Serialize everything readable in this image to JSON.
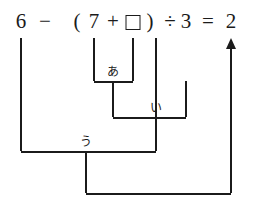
{
  "equation": {
    "tokens": [
      {
        "text": "6",
        "x": 21
      },
      {
        "text": "−",
        "x": 45
      },
      {
        "text": "(",
        "x": 77
      },
      {
        "text": "7",
        "x": 94
      },
      {
        "text": "+",
        "x": 113
      },
      {
        "text": ")",
        "x": 150
      },
      {
        "text": "÷",
        "x": 170
      },
      {
        "text": "3",
        "x": 186
      },
      {
        "text": "=",
        "x": 208
      },
      {
        "text": "2",
        "x": 231
      }
    ],
    "empty_box": {
      "name": "answer-box",
      "x": 133
    },
    "full_text": "6 − ( 7 + □ ) ÷ 3 = 2"
  },
  "tree": {
    "brackets": [
      {
        "id": "a",
        "label": "あ",
        "left_x": 94,
        "right_x": 133,
        "bar_y": 81,
        "top_y": 38,
        "stem_x": 113,
        "stem_to_y": 117,
        "label_x": 113,
        "label_y": 66
      },
      {
        "id": "i",
        "label": "い",
        "left_x": 113,
        "right_x": 186,
        "bar_y": 117,
        "top_y": 81,
        "stem_x": 156,
        "stem_to_y": 151,
        "label_x": 156,
        "label_y": 102
      },
      {
        "id": "u",
        "label": "う",
        "left_x": 21,
        "right_x": 156,
        "bar_y": 151,
        "top_y": 38,
        "stem_x": 86,
        "stem_to_y": 193,
        "label_x": 86,
        "label_y": 136
      }
    ],
    "result_connector": {
      "bar_y": 193,
      "left_x": 86,
      "right_x": 231
    },
    "arrow": {
      "x": 231,
      "from_y": 193,
      "to_y": 40,
      "head_y": 38
    }
  },
  "colors": {
    "ink": "#1b1b1b",
    "background": "#ffffff"
  }
}
